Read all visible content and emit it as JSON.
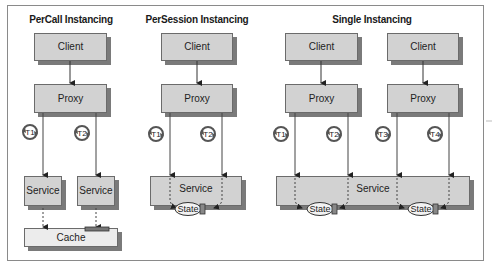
{
  "diagram": {
    "sections": [
      {
        "id": "percall",
        "title": "PerCall Instancing",
        "title_pos": [
          71,
          20
        ],
        "clients": [
          {
            "label": "Client",
            "x": 34,
            "y": 33,
            "w": 73,
            "h": 28
          }
        ],
        "proxies": [
          {
            "label": "Proxy",
            "x": 34,
            "y": 84,
            "w": 73,
            "h": 29
          }
        ],
        "threads": [
          {
            "label": "T1",
            "cx": 30,
            "cy": 132,
            "line_x": 43
          },
          {
            "label": "T2",
            "cx": 82,
            "cy": 133,
            "line_x": 96
          }
        ],
        "services": [
          {
            "label": "Service",
            "x": 24,
            "y": 176,
            "w": 38,
            "h": 30
          },
          {
            "label": "Service",
            "x": 77,
            "y": 176,
            "w": 38,
            "h": 30
          }
        ],
        "cache": {
          "label": "Cache",
          "x": 24,
          "y": 228,
          "w": 94,
          "h": 19
        }
      },
      {
        "id": "persession",
        "title": "PerSession Instancing",
        "title_pos": [
          197,
          20
        ],
        "clients": [
          {
            "label": "Client",
            "x": 161,
            "y": 33,
            "w": 72,
            "h": 28
          }
        ],
        "proxies": [
          {
            "label": "Proxy",
            "x": 161,
            "y": 84,
            "w": 72,
            "h": 29
          }
        ],
        "threads": [
          {
            "label": "T1",
            "cx": 156,
            "cy": 134,
            "line_x": 170
          },
          {
            "label": "T2",
            "cx": 208,
            "cy": 134,
            "line_x": 222
          }
        ],
        "services": [
          {
            "label": "Service",
            "x": 150,
            "y": 176,
            "w": 92,
            "h": 30
          }
        ],
        "states": [
          {
            "label": "State",
            "cx": 190,
            "cy": 209
          }
        ]
      },
      {
        "id": "single",
        "title": "Single Instancing",
        "title_pos": [
          372,
          20
        ],
        "clients": [
          {
            "label": "Client",
            "x": 285,
            "y": 33,
            "w": 73,
            "h": 28
          },
          {
            "label": "Client",
            "x": 387,
            "y": 33,
            "w": 72,
            "h": 28
          }
        ],
        "proxies": [
          {
            "label": "Proxy",
            "x": 285,
            "y": 84,
            "w": 73,
            "h": 29
          },
          {
            "label": "Proxy",
            "x": 387,
            "y": 84,
            "w": 72,
            "h": 29
          }
        ],
        "threads": [
          {
            "label": "T1",
            "cx": 281,
            "cy": 134,
            "line_x": 295
          },
          {
            "label": "T2",
            "cx": 334,
            "cy": 134,
            "line_x": 348
          },
          {
            "label": "T3",
            "cx": 383,
            "cy": 134,
            "line_x": 397
          },
          {
            "label": "T4",
            "cx": 435,
            "cy": 134,
            "line_x": 449
          }
        ],
        "services": [
          {
            "label": "Service",
            "x": 276,
            "y": 176,
            "w": 194,
            "h": 30
          }
        ],
        "states": [
          {
            "label": "State",
            "cx": 322,
            "cy": 209
          },
          {
            "label": "State",
            "cx": 423,
            "cy": 209
          }
        ]
      }
    ]
  }
}
